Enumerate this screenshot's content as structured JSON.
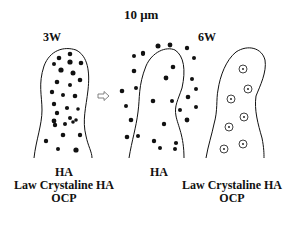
{
  "diagram": {
    "scale_label": "10 μm",
    "stage_labels": {
      "left": "3W",
      "right": "6W"
    },
    "arrow": "transition-arrow",
    "left_legend": [
      "HA",
      "Law Crystaline HA",
      "OCP"
    ],
    "middle_legend": [
      "HA"
    ],
    "right_legend": [
      "Law Crystaline HA",
      "OCP"
    ],
    "colors": {
      "ink": "#111111",
      "background": "#ffffff"
    }
  }
}
